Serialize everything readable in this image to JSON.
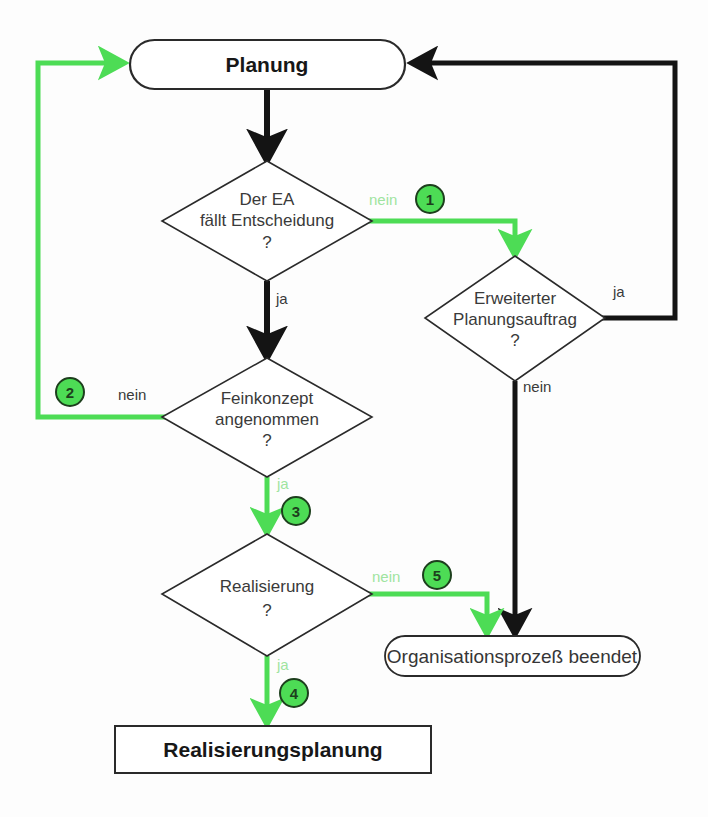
{
  "diagram": {
    "colors": {
      "green": "#4ddc55",
      "green_label": "#9fe4a0",
      "black": "#141414",
      "outline": "#2a2a2a",
      "background": "#fdfdfd",
      "marker_fill": "#4ddc55",
      "marker_stroke": "#1d3f1d"
    },
    "nodes": {
      "start": {
        "label": "Planung",
        "shape": "rounded-terminal"
      },
      "decision_ea": {
        "line1": "Der EA",
        "line2": "fällt Entscheidung",
        "line3": "?",
        "shape": "diamond"
      },
      "decision_auftrag": {
        "line1": "Erweiterter",
        "line2": "Planungsauftrag",
        "line3": "?",
        "shape": "diamond"
      },
      "decision_feinkonzept": {
        "line1": "Feinkonzept",
        "line2": "angenommen",
        "line3": "?",
        "shape": "diamond"
      },
      "decision_realisierung": {
        "line1": "Realisierung",
        "line2": "?",
        "shape": "diamond"
      },
      "end_process": {
        "label": "Organisationsprozeß beendet",
        "shape": "rounded-terminal"
      },
      "process_plan": {
        "label": "Realisierungsplanung",
        "shape": "rectangle"
      }
    },
    "edge_labels": {
      "ea_nein": "nein",
      "ea_ja": "ja",
      "auftrag_ja": "ja",
      "auftrag_nein": "nein",
      "feinkonzept_nein": "nein",
      "feinkonzept_ja": "ja",
      "realisierung_nein": "nein",
      "realisierung_ja": "ja"
    },
    "markers": {
      "m1": "1",
      "m2": "2",
      "m3": "3",
      "m4": "4",
      "m5": "5"
    }
  }
}
